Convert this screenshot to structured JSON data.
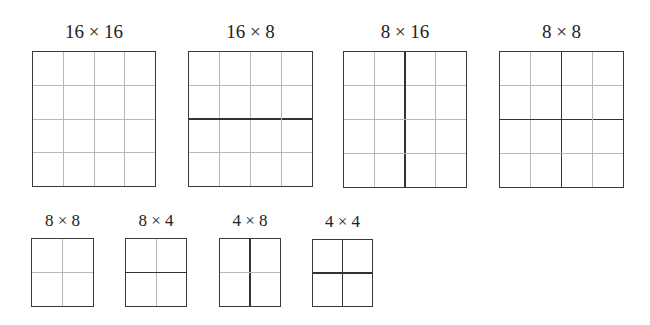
{
  "diagram": {
    "blocks": [
      {
        "label": "16 × 16",
        "size": "big",
        "x": 32,
        "y": 51,
        "w": 124,
        "h": 136,
        "grid": 4,
        "split": "none"
      },
      {
        "label": "16 × 8",
        "size": "big",
        "x": 188,
        "y": 51,
        "w": 125,
        "h": 136,
        "grid": 4,
        "split": "horizontal"
      },
      {
        "label": "8 × 16",
        "size": "big",
        "x": 343,
        "y": 51,
        "w": 124,
        "h": 137,
        "grid": 4,
        "split": "vertical"
      },
      {
        "label": "8 × 8",
        "size": "big",
        "x": 499,
        "y": 51,
        "w": 125,
        "h": 137,
        "grid": 4,
        "split": "quad"
      },
      {
        "label": "8 × 8",
        "size": "small",
        "x": 31,
        "y": 238,
        "w": 63,
        "h": 69,
        "grid": 2,
        "split": "none"
      },
      {
        "label": "8 × 4",
        "size": "small",
        "x": 125,
        "y": 238,
        "w": 62,
        "h": 69,
        "grid": 2,
        "split": "horizontal"
      },
      {
        "label": "4 × 8",
        "size": "small",
        "x": 219,
        "y": 238,
        "w": 62,
        "h": 69,
        "grid": 2,
        "split": "vertical"
      },
      {
        "label": "4 × 4",
        "size": "small",
        "x": 312,
        "y": 239,
        "w": 61,
        "h": 68,
        "grid": 2,
        "split": "quad"
      }
    ],
    "colors": {
      "border": "#3a3a3a",
      "grid_line": "#b8b8b8",
      "partition_line": "#333333",
      "text": "#222222"
    }
  }
}
